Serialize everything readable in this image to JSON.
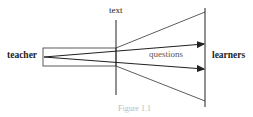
{
  "diagram": {
    "labels": {
      "teacher": "teacher",
      "learners": "learners",
      "text": "text",
      "questions": "questions",
      "caption": "Figure 1.1"
    },
    "colors": {
      "line": "#222222",
      "questions": "#555555"
    }
  }
}
